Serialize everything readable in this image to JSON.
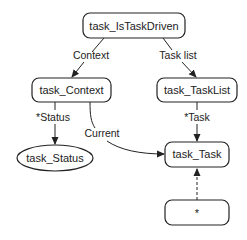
{
  "diagram": {
    "nodes": {
      "is_task_driven": {
        "label": "task_IsTaskDriven",
        "shape": "rounded-rect"
      },
      "context": {
        "label": "task_Context",
        "shape": "rounded-rect"
      },
      "task_list": {
        "label": "task_TaskList",
        "shape": "rounded-rect"
      },
      "status": {
        "label": "task_Status",
        "shape": "ellipse"
      },
      "task": {
        "label": "task_Task",
        "shape": "rounded-rect"
      },
      "any": {
        "label": "*",
        "shape": "rounded-rect"
      }
    },
    "edges": {
      "context": {
        "label": "Context",
        "from": "task_IsTaskDriven",
        "to": "task_Context",
        "style": "solid"
      },
      "task_list": {
        "label": "Task list",
        "from": "task_IsTaskDriven",
        "to": "task_TaskList",
        "style": "solid"
      },
      "status": {
        "label": "*Status",
        "from": "task_Context",
        "to": "task_Status",
        "style": "solid"
      },
      "current": {
        "label": "Current",
        "from": "task_Context",
        "to": "task_Task",
        "style": "solid-curved"
      },
      "task": {
        "label": "*Task",
        "from": "task_TaskList",
        "to": "task_Task",
        "style": "solid"
      },
      "inherit": {
        "label": "",
        "from": "*",
        "to": "task_Task",
        "style": "dashed"
      }
    },
    "colors": {
      "stroke": "#222222",
      "fill": "#ffffff",
      "text": "#222222"
    }
  }
}
